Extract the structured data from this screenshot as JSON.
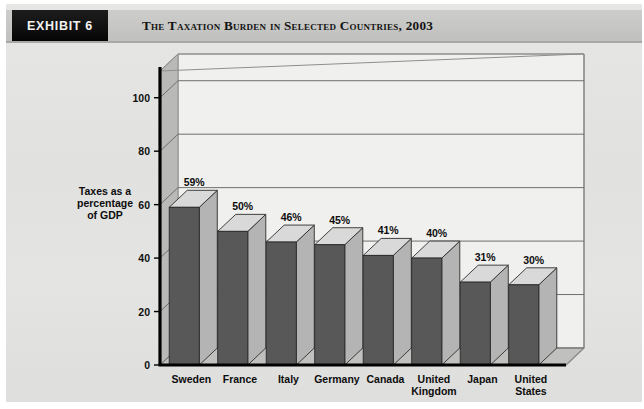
{
  "exhibit": {
    "badge_label": "EXHIBIT 6",
    "title": "The Taxation Burden in Selected Countries, 2003"
  },
  "colors": {
    "paper_background": "#e3e3e1",
    "header_band": "#c9c9c7",
    "badge_background": "#141414",
    "badge_text": "#f2f2f2",
    "title_text": "#131313",
    "bar_front": "#585858",
    "bar_side": "#b4b4b4",
    "bar_top": "#d9d9d9",
    "plot_back_wall": "#f0f0ee",
    "plot_left_wall": "#b9b9b7",
    "plot_floor": "#c0c0be",
    "gridline": "#6e6e6e",
    "axis_line": "#000000"
  },
  "chart_data": {
    "type": "bar",
    "title": "The Taxation Burden in Selected Countries, 2003",
    "xlabel": "Country",
    "ylabel": "Taxes as a percentage of GDP",
    "ylabel_lines": [
      "Taxes as a",
      "percentage",
      "of GDP"
    ],
    "categories": [
      "Sweden",
      "France",
      "Italy",
      "Germany",
      "Canada",
      "United Kingdom",
      "Japan",
      "United States"
    ],
    "category_lines": [
      [
        "Sweden"
      ],
      [
        "France"
      ],
      [
        "Italy"
      ],
      [
        "Germany"
      ],
      [
        "Canada"
      ],
      [
        "United",
        "Kingdom"
      ],
      [
        "Japan"
      ],
      [
        "United",
        "States"
      ]
    ],
    "values": [
      59,
      50,
      46,
      45,
      41,
      40,
      31,
      30
    ],
    "value_labels": [
      "59%",
      "50%",
      "46%",
      "45%",
      "41%",
      "40%",
      "31%",
      "30%"
    ],
    "ylim": [
      0,
      110
    ],
    "yticks": [
      0,
      20,
      40,
      60,
      80,
      100
    ],
    "ytick_labels": [
      "0",
      "20",
      "40",
      "60",
      "80",
      "100"
    ],
    "grid": true,
    "grid_axis": "y",
    "legend": false,
    "three_d": true
  }
}
